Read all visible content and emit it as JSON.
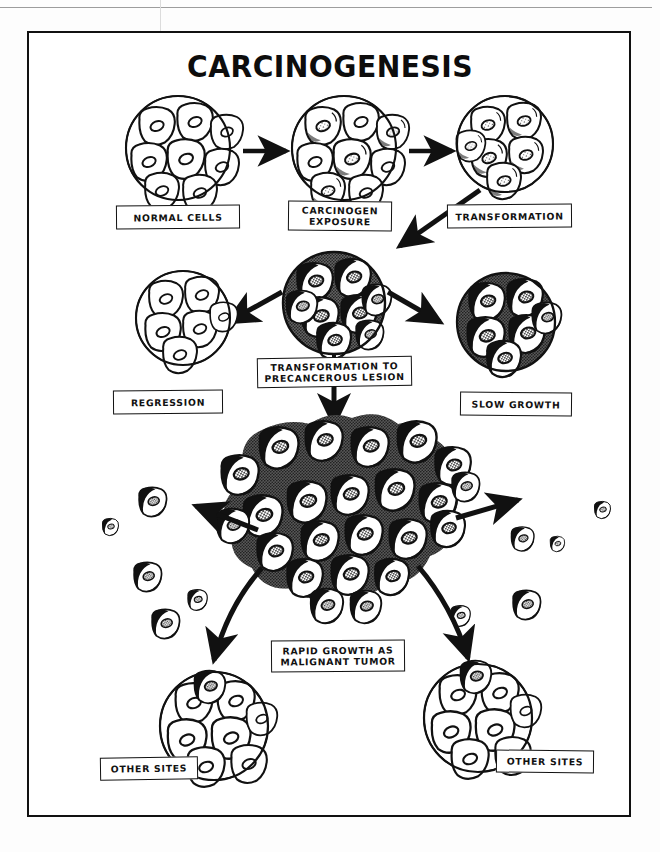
{
  "document": {
    "title": "CARCINOGENESIS",
    "ink_color": "#111111",
    "paper_color": "#ffffff"
  },
  "labels": {
    "normal_cells": "NORMAL CELLS",
    "carcinogen_exposure": "CARCINOGEN\nEXPOSURE",
    "transformation": "TRANSFORMATION",
    "regression": "REGRESSION",
    "transformation_to_precancerous_lesion": "TRANSFORMATION TO\nPRECANCEROUS LESION",
    "slow_growth": "SLOW GROWTH",
    "rapid_growth": "RAPID GROWTH AS\nMALIGNANT TUMOR",
    "other_sites_left": "OTHER SITES",
    "other_sites_right": "OTHER SITES"
  },
  "diagram": {
    "type": "flow-diagram",
    "stages": [
      {
        "id": "normal-cells",
        "label": "NORMAL CELLS",
        "row": 1,
        "appearance": "clean outlined cell cluster"
      },
      {
        "id": "carcinogen-exposure",
        "label": "CARCINOGEN EXPOSURE",
        "row": 1,
        "appearance": "outlined cluster, faint stippling"
      },
      {
        "id": "transformation",
        "label": "TRANSFORMATION",
        "row": 1,
        "appearance": "cluster with darkened nuclei"
      },
      {
        "id": "precancerous-lesion",
        "label": "TRANSFORMATION TO PRECANCEROUS LESION",
        "row": 2,
        "appearance": "heavily shaded cluster"
      },
      {
        "id": "regression",
        "label": "REGRESSION",
        "row": 2,
        "appearance": "clean outlined cluster"
      },
      {
        "id": "slow-growth",
        "label": "SLOW GROWTH",
        "row": 2,
        "appearance": "dark textured cluster"
      },
      {
        "id": "malignant-tumor",
        "label": "RAPID GROWTH AS MALIGNANT TUMOR",
        "row": 3,
        "appearance": "large irregular dense black mass"
      },
      {
        "id": "other-sites-left",
        "label": "OTHER SITES",
        "row": 4,
        "appearance": "normal cluster with one dark invading cell"
      },
      {
        "id": "other-sites-right",
        "label": "OTHER SITES",
        "row": 4,
        "appearance": "normal cluster with one dark invading cell"
      }
    ],
    "arrows": [
      {
        "from": "normal-cells",
        "to": "carcinogen-exposure",
        "style": "straight-right"
      },
      {
        "from": "carcinogen-exposure",
        "to": "transformation",
        "style": "straight-right"
      },
      {
        "from": "transformation",
        "to": "precancerous-lesion",
        "style": "diagonal-down-left"
      },
      {
        "from": "precancerous-lesion",
        "to": "regression",
        "style": "diagonal-down-left"
      },
      {
        "from": "precancerous-lesion",
        "to": "slow-growth",
        "style": "diagonal-down-right"
      },
      {
        "from": "precancerous-lesion",
        "to": "malignant-tumor",
        "style": "straight-down"
      },
      {
        "from": "malignant-tumor",
        "to": "other-sites-left",
        "style": "curve-down-left"
      },
      {
        "from": "malignant-tumor",
        "to": "other-sites-right",
        "style": "curve-down-right"
      },
      {
        "from": "malignant-tumor",
        "to": "metastatic-cells-left",
        "style": "diagonal-up-left"
      },
      {
        "from": "malignant-tumor",
        "to": "metastatic-cells-right",
        "style": "diagonal-up-right"
      }
    ],
    "metastatic_cells_count": 14
  }
}
